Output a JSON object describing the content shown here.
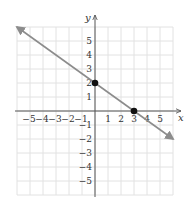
{
  "chart_data": {
    "type": "line",
    "title": "",
    "xlabel": "x",
    "ylabel": "y",
    "xlim": [
      -6,
      6
    ],
    "ylim": [
      -6,
      6
    ],
    "grid": true,
    "x_ticks": [
      "−5",
      "−4",
      "−3",
      "−2",
      "−1",
      "1",
      "2",
      "3",
      "4",
      "5"
    ],
    "y_ticks": [
      "5",
      "4",
      "3",
      "2",
      "1",
      "−1",
      "−2",
      "−3",
      "−4",
      "−5"
    ],
    "series": [
      {
        "name": "line",
        "equation": "y = -2/3 x + 2",
        "slope": -0.6667,
        "intercept": 2,
        "arrows": "both ends",
        "color": "#8c8c8c"
      }
    ],
    "points": [
      {
        "x": 0,
        "y": 2,
        "label": "y-intercept"
      },
      {
        "x": 3,
        "y": 0,
        "label": "x-intercept"
      }
    ],
    "colors": {
      "grid": "#e2e2e2",
      "axis": "#555555",
      "line": "#8c8c8c",
      "point": "#111111"
    }
  }
}
